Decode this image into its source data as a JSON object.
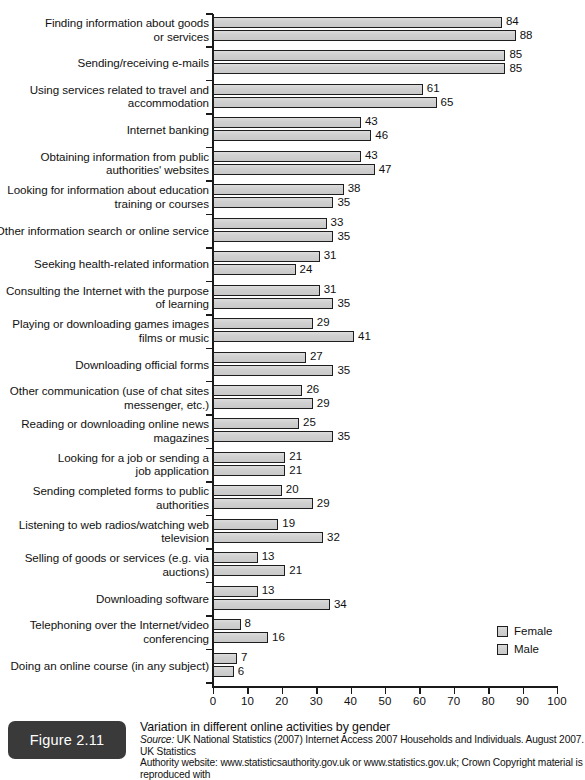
{
  "figure": {
    "badge_label": "Figure 2.11",
    "title": "Variation in different online activities by gender",
    "source_prefix": "Source:",
    "source_line1": " UK National Statistics (2007) Internet Access 2007 Households and Individuals. August 2007. UK Statistics",
    "source_line2": "Authority website: www.statisticsauthority.gov.uk or www.statistics.gov.uk; Crown Copyright material is reproduced with"
  },
  "legend": {
    "items": [
      {
        "label": "Female",
        "color": "#d2d2d2"
      },
      {
        "label": "Male",
        "color": "#d2d2d2"
      }
    ]
  },
  "chart_data": {
    "type": "bar",
    "orientation": "horizontal",
    "title": "Variation in different online activities by gender",
    "xlabel": "",
    "ylabel": "",
    "xlim": [
      0,
      100
    ],
    "xticks": [
      0,
      10,
      20,
      30,
      40,
      50,
      60,
      70,
      80,
      90,
      100
    ],
    "grid": false,
    "legend_position": "bottom-right",
    "categories": [
      "Finding information about goods or services",
      "Sending/receiving e-mails",
      "Using services related to travel and accommodation",
      "Internet banking",
      "Obtaining information from public authorities' websites",
      "Looking for information about education training or courses",
      "Other information search or online service",
      "Seeking health-related information",
      "Consulting the Internet with the purpose of learning",
      "Playing or downloading games images films or music",
      "Downloading official forms",
      "Other communication (use of chat sites messenger, etc.)",
      "Reading or downloading online news magazines",
      "Looking for a job or sending a job application",
      "Sending completed forms to public authorities",
      "Listening to web radios/watching web television",
      "Selling of goods or services (e.g. via auctions)",
      "Downloading software",
      "Telephoning over the Internet/video conferencing",
      "Doing an online course (in any subject)"
    ],
    "category_lines": [
      [
        "Finding information about goods",
        "or services"
      ],
      [
        "Sending/receiving e-mails"
      ],
      [
        "Using services related to travel and",
        "accommodation"
      ],
      [
        "Internet banking"
      ],
      [
        "Obtaining information from public",
        "authorities' websites"
      ],
      [
        "Looking for information about education",
        "training or courses"
      ],
      [
        "Other information search or online service"
      ],
      [
        "Seeking health-related information"
      ],
      [
        "Consulting the Internet with the purpose",
        "of learning"
      ],
      [
        "Playing or downloading games images",
        "films or music"
      ],
      [
        "Downloading official forms"
      ],
      [
        "Other communication (use of chat sites",
        "messenger, etc.)"
      ],
      [
        "Reading or downloading online news",
        "magazines"
      ],
      [
        "Looking for a job or sending a",
        "job application"
      ],
      [
        "Sending completed forms to public",
        "authorities"
      ],
      [
        "Listening to web radios/watching web",
        "television"
      ],
      [
        "Selling of goods or services (e.g. via",
        "auctions)"
      ],
      [
        "Downloading software"
      ],
      [
        "Telephoning over the Internet/video",
        "conferencing"
      ],
      [
        "Doing an online course (in any subject)"
      ]
    ],
    "series": [
      {
        "name": "Female",
        "values": [
          84,
          85,
          61,
          43,
          43,
          38,
          33,
          31,
          31,
          29,
          27,
          26,
          25,
          21,
          20,
          19,
          13,
          13,
          8,
          7
        ]
      },
      {
        "name": "Male",
        "values": [
          88,
          85,
          65,
          46,
          47,
          35,
          35,
          24,
          35,
          41,
          35,
          29,
          35,
          21,
          29,
          32,
          21,
          34,
          16,
          6
        ]
      }
    ]
  }
}
